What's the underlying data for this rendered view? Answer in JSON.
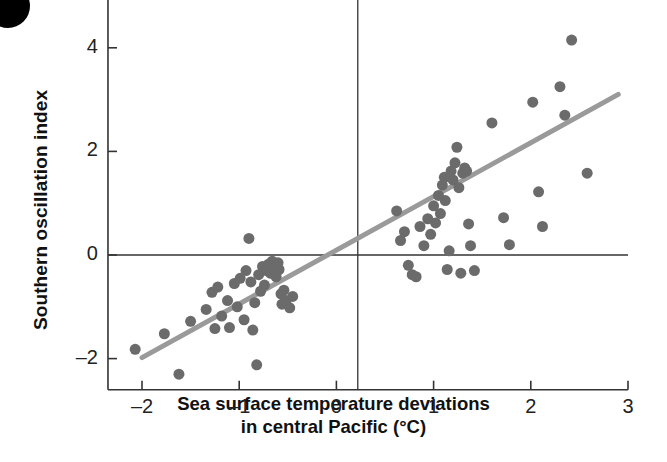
{
  "figure": {
    "artifact": "black-corner-blob"
  },
  "chart_data": {
    "type": "scatter",
    "title": "",
    "xlabel_line1": "Sea surface temperature deviations",
    "xlabel_line2": "in central Pacific (°C)",
    "xlabel": "Sea surface temperature deviations in central Pacific (°C)",
    "ylabel": "Southern oscillation index",
    "xlim": [
      -2.4,
      3.1
    ],
    "ylim": [
      -2.6,
      6.3
    ],
    "xticks": [
      -2,
      -1,
      0,
      1,
      2,
      3
    ],
    "xticklabels": [
      "–2",
      "–1",
      "0",
      "1",
      "2",
      "3"
    ],
    "yticks": [
      -2,
      0,
      2,
      4,
      6
    ],
    "yticklabels": [
      "–2",
      "0",
      "2",
      "4",
      "6"
    ],
    "grid": false,
    "legend": null,
    "marker_color": "#6b6b6b",
    "marker_size": 11,
    "trendline": {
      "color": "#9a9a9a",
      "width": 5,
      "x0": -2.0,
      "y0": -1.98,
      "x1": 2.9,
      "y1": 3.1
    },
    "reference_lines": [
      {
        "name": "horizontal-zero",
        "orientation": "horizontal",
        "value": 0,
        "color": "#333333"
      },
      {
        "name": "vertical-threshold",
        "orientation": "vertical",
        "value": 0.22,
        "color": "#333333"
      }
    ],
    "points": [
      [
        -2.07,
        -1.82
      ],
      [
        -1.77,
        -1.52
      ],
      [
        -1.62,
        -2.3
      ],
      [
        -1.5,
        -1.28
      ],
      [
        -1.34,
        -1.05
      ],
      [
        -1.28,
        -0.72
      ],
      [
        -1.25,
        -1.42
      ],
      [
        -1.22,
        -0.62
      ],
      [
        -1.18,
        -1.18
      ],
      [
        -1.12,
        -0.88
      ],
      [
        -1.1,
        -1.4
      ],
      [
        -1.05,
        -0.55
      ],
      [
        -1.02,
        -1.0
      ],
      [
        -0.99,
        -0.45
      ],
      [
        -0.95,
        -1.25
      ],
      [
        -0.93,
        -0.3
      ],
      [
        -0.9,
        0.32
      ],
      [
        -0.88,
        -0.52
      ],
      [
        -0.86,
        -1.45
      ],
      [
        -0.84,
        -0.92
      ],
      [
        -0.82,
        -2.12
      ],
      [
        -0.8,
        -0.38
      ],
      [
        -0.78,
        -0.7
      ],
      [
        -0.76,
        -0.22
      ],
      [
        -0.74,
        -0.58
      ],
      [
        -0.72,
        -0.3
      ],
      [
        -0.7,
        -0.18
      ],
      [
        -0.68,
        -0.35
      ],
      [
        -0.66,
        -0.12
      ],
      [
        -0.65,
        -0.25
      ],
      [
        -0.63,
        -0.2
      ],
      [
        -0.62,
        -0.42
      ],
      [
        -0.6,
        -0.15
      ],
      [
        -0.59,
        -0.28
      ],
      [
        -0.57,
        -0.75
      ],
      [
        -0.56,
        -0.95
      ],
      [
        -0.54,
        -0.68
      ],
      [
        -0.52,
        -0.88
      ],
      [
        -0.48,
        -1.02
      ],
      [
        -0.45,
        -0.8
      ],
      [
        0.62,
        0.85
      ],
      [
        0.66,
        0.28
      ],
      [
        0.7,
        0.45
      ],
      [
        0.74,
        -0.2
      ],
      [
        0.78,
        -0.38
      ],
      [
        0.82,
        -0.42
      ],
      [
        0.86,
        0.55
      ],
      [
        0.9,
        0.18
      ],
      [
        0.94,
        0.7
      ],
      [
        0.97,
        0.4
      ],
      [
        1.0,
        0.95
      ],
      [
        1.02,
        0.62
      ],
      [
        1.05,
        1.15
      ],
      [
        1.07,
        0.8
      ],
      [
        1.09,
        1.35
      ],
      [
        1.11,
        1.5
      ],
      [
        1.12,
        1.05
      ],
      [
        1.14,
        -0.28
      ],
      [
        1.16,
        0.08
      ],
      [
        1.18,
        1.62
      ],
      [
        1.2,
        1.45
      ],
      [
        1.22,
        1.78
      ],
      [
        1.24,
        2.08
      ],
      [
        1.26,
        1.3
      ],
      [
        1.28,
        -0.35
      ],
      [
        1.3,
        1.58
      ],
      [
        1.32,
        1.68
      ],
      [
        1.34,
        1.62
      ],
      [
        1.36,
        0.6
      ],
      [
        1.38,
        0.18
      ],
      [
        1.42,
        -0.3
      ],
      [
        1.6,
        2.55
      ],
      [
        1.72,
        0.72
      ],
      [
        1.78,
        0.2
      ],
      [
        2.02,
        2.95
      ],
      [
        2.08,
        1.22
      ],
      [
        2.12,
        0.55
      ],
      [
        2.3,
        3.25
      ],
      [
        2.35,
        2.7
      ],
      [
        2.42,
        4.15
      ],
      [
        2.58,
        1.58
      ]
    ]
  }
}
